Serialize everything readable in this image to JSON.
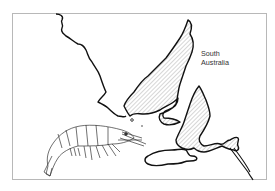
{
  "map": {
    "region_label": [
      "South",
      "Australia"
    ],
    "features": [
      "coastline",
      "Yorke Peninsula (hatched)",
      "Eyre Peninsula coast",
      "Kangaroo Island",
      "Fleurieu Peninsula (hatched)",
      "Murray mouth",
      "prawn illustration"
    ],
    "colors": {
      "frame": "#b8b8b8",
      "coast": "#111111",
      "hatch": "#8a8a8a",
      "background": "#ffffff"
    }
  }
}
